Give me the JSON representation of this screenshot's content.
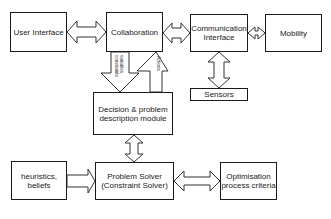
{
  "nodes": {
    "user_interface": "User Interface",
    "collaboration": "Collaboration",
    "communication_interface_1": "Communication",
    "communication_interface_2": "Interface",
    "mobility": "Mobility",
    "sensors": "Sensors",
    "decision_1": "Decision & problem",
    "decision_2": "description module",
    "problem_solver_1": "Problem Solver",
    "problem_solver_2": "(Constraint Solver)",
    "heuristics_1": "heuristics,",
    "heuristics_2": "beliefs",
    "optimisation_1": "Optimisation",
    "optimisation_2": "process criteria"
  },
  "edges": {
    "down_label_1": "variables,",
    "down_label_2": "constraints",
    "up_label": "Actions"
  },
  "colors": {
    "stroke": "#1a1a1a",
    "fill": "#ffffff"
  }
}
